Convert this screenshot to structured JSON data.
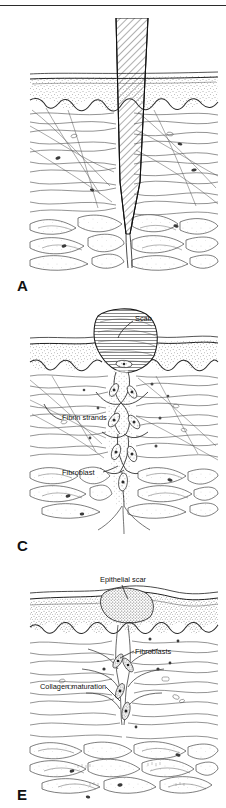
{
  "figure": {
    "width": 226,
    "height": 808,
    "background": "#ffffff",
    "ink_color": "#1a1a1a",
    "panel_count": 3
  },
  "panels": [
    {
      "letter": "A",
      "letter_x": 17,
      "letter_y": 277,
      "caption": "Incised wound penetrating epidermis, dermis and subcutaneous fat",
      "region": {
        "x": 30,
        "y": 20,
        "w": 188,
        "h": 252
      },
      "labels": [],
      "features": [
        "blade-shaped hatched wound tract",
        "stippled epidermis band",
        "wavy dermo-epidermal junction",
        "collagen fiber bundles of dermis",
        "lobulated subcutaneous adipose tissue"
      ]
    },
    {
      "letter": "C",
      "letter_x": 17,
      "letter_y": 537,
      "caption": "Granulation tissue with scab, fibrin strands and migrating fibroblasts",
      "region": {
        "x": 30,
        "y": 300,
        "w": 188,
        "h": 232
      },
      "labels": [
        {
          "id": "scab",
          "text": "Scab",
          "x": 135,
          "y": 321,
          "anchor": "start",
          "leader": {
            "x1": 133,
            "y1": 319,
            "x2": 118,
            "y2": 337
          }
        },
        {
          "id": "fibrin-strands",
          "text": "Fibrin strands",
          "x": 62,
          "y": 420,
          "anchor": "start",
          "leader": {
            "x1": 60,
            "y1": 418,
            "x2": 44,
            "y2": 404
          }
        },
        {
          "id": "fibroblast",
          "text": "Fibroblast",
          "x": 62,
          "y": 475,
          "anchor": "start",
          "leader": {
            "x1": 103,
            "y1": 472,
            "x2": 117,
            "y2": 466
          }
        }
      ],
      "features": [
        "hatched scab cap above wound",
        "fibrin strand network bridging wound gap",
        "spindle-shaped fibroblasts",
        "capillary sprouts"
      ]
    },
    {
      "letter": "E",
      "letter_x": 17,
      "letter_y": 787,
      "caption": "Mature scar with epithelial scar, fibroblasts and collagen maturation",
      "region": {
        "x": 30,
        "y": 565,
        "w": 188,
        "h": 232
      },
      "labels": [
        {
          "id": "epithelial-scar",
          "text": "Epithelial scar",
          "x": 100,
          "y": 581,
          "anchor": "start",
          "leader": {
            "x1": 122,
            "y1": 584,
            "x2": 120,
            "y2": 598
          }
        },
        {
          "id": "fibroblasts",
          "text": "Fibroblasts",
          "x": 135,
          "y": 654,
          "anchor": "start",
          "leader": {
            "x1": 134,
            "y1": 651,
            "x2": 119,
            "y2": 657
          }
        },
        {
          "id": "collagen-maturation",
          "text": "Collagen maturation",
          "x": 40,
          "y": 689,
          "anchor": "start",
          "leader": {
            "x1": 104,
            "y1": 686,
            "x2": 119,
            "y2": 699
          }
        }
      ],
      "features": [
        "dense stippled epidermis over scar",
        "converging mature collagen bundles",
        "residual fibroblasts",
        "deep adipose lobules"
      ]
    }
  ],
  "legend": {
    "note": "Letters A, C and E denote sequential stages of repair"
  }
}
